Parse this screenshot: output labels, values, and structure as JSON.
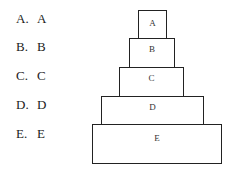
{
  "options": [
    {
      "key": "A.",
      "value": "A"
    },
    {
      "key": "B.",
      "value": "B"
    },
    {
      "key": "C.",
      "value": "C"
    },
    {
      "key": "D.",
      "value": "D"
    },
    {
      "key": "E.",
      "value": "E"
    }
  ],
  "pyramid": {
    "tiers": [
      {
        "label": "A"
      },
      {
        "label": "B"
      },
      {
        "label": "C"
      },
      {
        "label": "D"
      },
      {
        "label": "E"
      }
    ]
  }
}
